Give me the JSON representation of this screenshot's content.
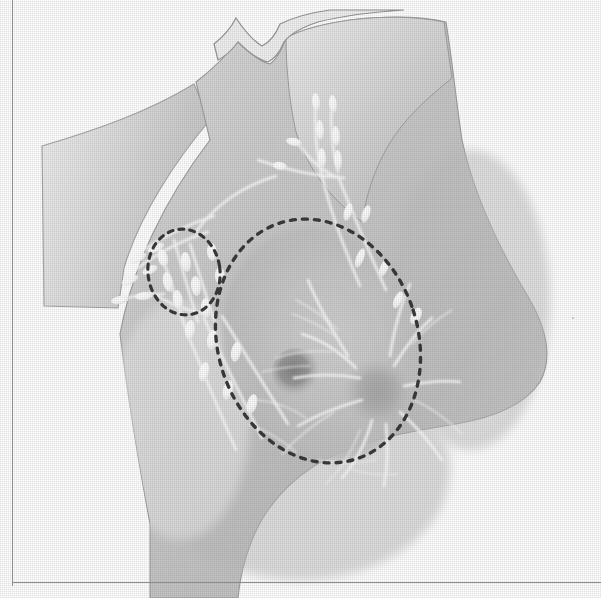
{
  "figure": {
    "domain_label": "anatomical-illustration",
    "medium": "halftone printed grayscale plate",
    "page_rules": {
      "left_rule_x": 12,
      "bottom_rule_y": 582,
      "rule_color": "#8e8e8e"
    },
    "palette": {
      "page_background": "#ffffff",
      "skin_light": "#ececec",
      "skin_mid": "#c9c9c9",
      "skin_shadow": "#b4b4b4",
      "skin_edge": "#9a9a9a",
      "outline": "#8a8a8a",
      "vessel_white": "#fbfbfb",
      "node_white": "#ffffff",
      "areola_gray": "#b2b2b2",
      "lesion_dark": "#8f8f8f",
      "dashed_marker": "#3a3a3a"
    },
    "regions": [
      {
        "name": "head-and-jaw",
        "label": "Chin and jaw line, upper right of plate"
      },
      {
        "name": "neck",
        "label": "Neck with supraclavicular lymphatic chain"
      },
      {
        "name": "shoulder",
        "label": "Shoulder contour sweeping to upper left"
      },
      {
        "name": "upper-arm",
        "label": "Upper arm, abducted, cropped at left edge"
      },
      {
        "name": "chest-wall",
        "label": "Anterior chest wall and torso"
      },
      {
        "name": "breast",
        "label": "Breast with areola and nipple"
      },
      {
        "name": "axilla",
        "label": "Axilla containing axillary node group"
      }
    ],
    "markers": [
      {
        "name": "breast-outline",
        "shape": "dashed-ellipse",
        "label": "Dashed ellipse outlining the breast tissue field",
        "center": [
          318,
          341
        ],
        "radii": [
          100,
          124
        ],
        "rotation_deg": -18,
        "dash": "5 7",
        "color": "#3a3a3a"
      },
      {
        "name": "axillary-node-group-outline",
        "shape": "dashed-circle",
        "label": "Dashed circle outlining the axillary lymph node group",
        "center": [
          184,
          272
        ],
        "radii": [
          36,
          43
        ],
        "rotation_deg": -8,
        "dash": "5 6",
        "color": "#3a3a3a"
      }
    ],
    "features": [
      {
        "name": "areola",
        "label": "Areola",
        "center": [
          378,
          392
        ],
        "radius": 34
      },
      {
        "name": "nipple",
        "label": "Nipple",
        "center": [
          378,
          390
        ],
        "radius": 13
      },
      {
        "name": "lesion",
        "label": "Dark focal density within upper inner breast",
        "center": [
          296,
          372
        ],
        "radius": 22
      }
    ],
    "lymphatics": {
      "label": "White lymphatic vessels with bead-like lymph nodes",
      "vessel_count": 23,
      "node_count": 34,
      "chains": [
        {
          "name": "supraclavicular-chain",
          "label": "Supraclavicular / cervical chain ascending the neck"
        },
        {
          "name": "axillary-chain",
          "label": "Axillary chain within the dashed circle"
        },
        {
          "name": "lateral-chain",
          "label": "Lateral thoracic vessels descending the chest wall"
        },
        {
          "name": "subareolar-plexus",
          "label": "Subareolar plexus radiating from the areola"
        }
      ]
    }
  }
}
